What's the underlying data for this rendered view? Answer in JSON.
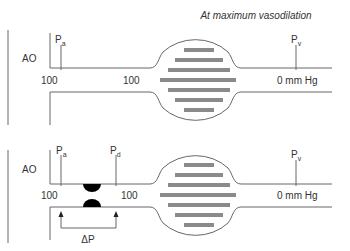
{
  "title": "At maximum vasodilation",
  "colors": {
    "line": "#666666",
    "bar": "#8a8a8a",
    "stenosis": "#000000",
    "text": "#333333"
  },
  "top_panel": {
    "vessel_label": "AO",
    "markers": [
      {
        "symbol": "P",
        "subscript": "a"
      },
      {
        "symbol": "P",
        "subscript": "v"
      }
    ],
    "pressures": [
      "100",
      "100",
      "0 mm Hg"
    ]
  },
  "bottom_panel": {
    "vessel_label": "AO",
    "markers": [
      {
        "symbol": "P",
        "subscript": "a"
      },
      {
        "symbol": "P",
        "subscript": "d"
      },
      {
        "symbol": "P",
        "subscript": "v"
      }
    ],
    "pressures": [
      "100",
      "100",
      "0 mm Hg"
    ],
    "gradient_label": "ΔP"
  }
}
